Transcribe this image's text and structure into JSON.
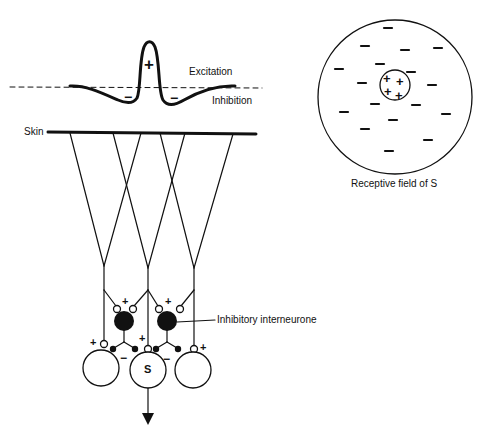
{
  "diagram": {
    "type": "neural-lateral-inhibition",
    "profile": {
      "excitation_label": "Excitation",
      "inhibition_label": "Inhibition",
      "center_sign": "+",
      "surround_signs": [
        "−",
        "−"
      ]
    },
    "skin_label": "Skin",
    "interneurone_label": "Inhibitory interneurone",
    "output_cell_label": "S",
    "receptive_field": {
      "caption": "Receptive field of S",
      "center_signs": [
        "+",
        "+",
        "+",
        "+"
      ],
      "surround_sign": "−"
    },
    "synapse_signs": {
      "excitatory": "+",
      "inhibitory": "−"
    },
    "colors": {
      "ink": "#111111",
      "background": "#ffffff"
    }
  }
}
